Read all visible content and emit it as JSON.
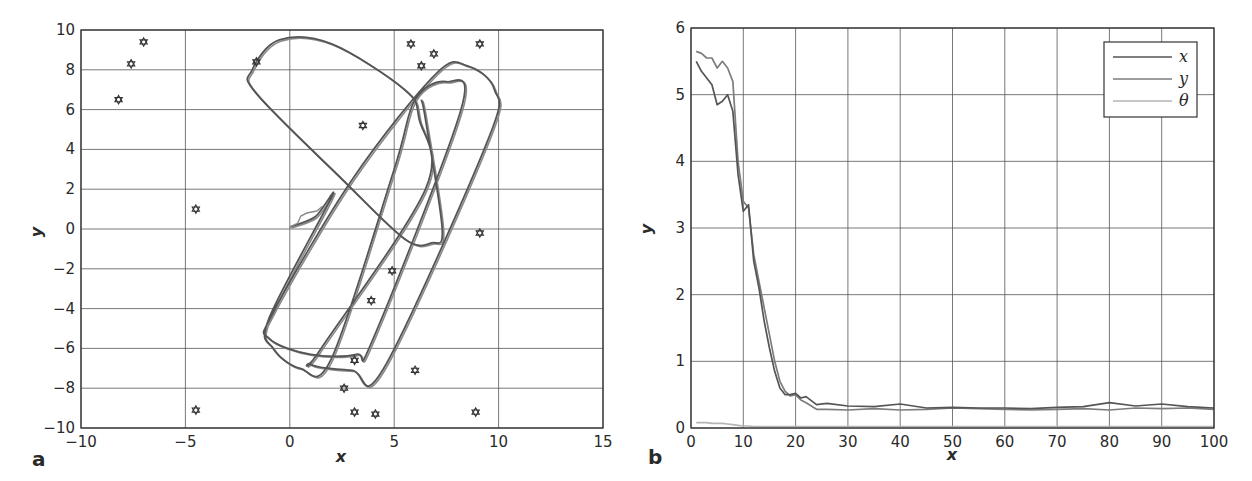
{
  "chart_data": [
    {
      "panel": "a",
      "type": "line",
      "title": "",
      "xlabel": "x",
      "ylabel": "y",
      "xlim": [
        -10,
        15
      ],
      "ylim": [
        -10,
        10
      ],
      "xticks": [
        -10,
        -5,
        0,
        5,
        10,
        15
      ],
      "yticks": [
        -10,
        -8,
        -6,
        -4,
        -2,
        0,
        2,
        4,
        6,
        8,
        10
      ],
      "grid": true,
      "colors": {
        "true_path": "#555555",
        "estimated_path": "#8a8a8a",
        "landmark": "#333333"
      },
      "landmarks": [
        [
          -8.2,
          6.5
        ],
        [
          -7.6,
          8.3
        ],
        [
          -7.0,
          9.4
        ],
        [
          -1.6,
          8.4
        ],
        [
          -4.5,
          1.0
        ],
        [
          3.5,
          5.2
        ],
        [
          5.8,
          9.3
        ],
        [
          6.3,
          8.2
        ],
        [
          6.9,
          8.8
        ],
        [
          9.1,
          9.3
        ],
        [
          9.1,
          -0.2
        ],
        [
          4.9,
          -2.1
        ],
        [
          3.9,
          -3.6
        ],
        [
          3.1,
          -6.6
        ],
        [
          6.0,
          -7.1
        ],
        [
          2.6,
          -8.0
        ],
        [
          3.1,
          -9.2
        ],
        [
          4.1,
          -9.3
        ],
        [
          8.9,
          -9.2
        ],
        [
          -4.5,
          -9.1
        ]
      ],
      "series": [
        {
          "name": "true trajectory",
          "points": [
            [
              0.0,
              0.1
            ],
            [
              1.2,
              0.6
            ],
            [
              2.0,
              1.6
            ],
            [
              -1.0,
              -4.5
            ],
            [
              -0.8,
              -6.0
            ],
            [
              0.5,
              -7.0
            ],
            [
              2.0,
              -6.5
            ],
            [
              5.0,
              3.0
            ],
            [
              6.0,
              6.5
            ],
            [
              7.5,
              7.4
            ],
            [
              8.2,
              6.0
            ],
            [
              4.0,
              -5.5
            ],
            [
              3.2,
              -6.3
            ],
            [
              1.0,
              -6.3
            ],
            [
              -1.0,
              -5.5
            ],
            [
              -0.8,
              -4.2
            ],
            [
              3.0,
              2.5
            ],
            [
              7.0,
              7.8
            ],
            [
              8.5,
              8.2
            ],
            [
              9.8,
              7.0
            ],
            [
              9.5,
              4.5
            ],
            [
              4.5,
              -7.0
            ],
            [
              3.0,
              -7.1
            ],
            [
              1.0,
              -6.8
            ],
            [
              1.5,
              -6.0
            ],
            [
              6.5,
              2.0
            ],
            [
              6.2,
              5.5
            ],
            [
              5.5,
              7.0
            ],
            [
              2.0,
              9.3
            ],
            [
              -0.5,
              9.5
            ],
            [
              -1.8,
              8.0
            ],
            [
              -1.6,
              6.8
            ],
            [
              2.5,
              2.5
            ],
            [
              5.5,
              -0.5
            ],
            [
              6.8,
              -0.7
            ],
            [
              7.3,
              0.0
            ],
            [
              6.5,
              5.5
            ],
            [
              6.3,
              6.5
            ]
          ]
        }
      ],
      "start_point": [
        0.0,
        0.1
      ],
      "panel_label": "a"
    },
    {
      "panel": "b",
      "type": "line",
      "title": "",
      "xlabel": "x",
      "ylabel": "y",
      "xlim": [
        0,
        100
      ],
      "ylim": [
        0,
        6
      ],
      "xticks": [
        0,
        10,
        20,
        30,
        40,
        50,
        60,
        70,
        80,
        90,
        100
      ],
      "yticks": [
        0,
        1,
        2,
        3,
        4,
        5,
        6
      ],
      "grid": true,
      "legend": {
        "position": "upper right",
        "entries": [
          "x",
          "y",
          "θ"
        ]
      },
      "x": [
        1,
        2,
        3,
        4,
        5,
        6,
        7,
        8,
        9,
        10,
        11,
        12,
        13,
        14,
        15,
        16,
        17,
        18,
        19,
        20,
        21,
        22,
        24,
        26,
        30,
        35,
        40,
        45,
        50,
        55,
        60,
        65,
        70,
        75,
        80,
        85,
        90,
        95,
        100
      ],
      "series": [
        {
          "name": "x",
          "color": "#555555",
          "values": [
            5.5,
            5.35,
            5.25,
            5.15,
            4.85,
            4.9,
            5.0,
            4.75,
            3.8,
            3.25,
            3.35,
            2.5,
            2.1,
            1.6,
            1.2,
            0.85,
            0.6,
            0.5,
            0.5,
            0.52,
            0.45,
            0.47,
            0.35,
            0.37,
            0.33,
            0.32,
            0.36,
            0.3,
            0.31,
            0.3,
            0.3,
            0.29,
            0.31,
            0.32,
            0.38,
            0.33,
            0.36,
            0.32,
            0.3
          ]
        },
        {
          "name": "y",
          "color": "#7d7d7d",
          "values": [
            5.65,
            5.62,
            5.55,
            5.55,
            5.4,
            5.5,
            5.4,
            5.2,
            4.0,
            3.4,
            3.3,
            2.6,
            2.2,
            1.8,
            1.4,
            1.0,
            0.7,
            0.55,
            0.48,
            0.5,
            0.42,
            0.38,
            0.28,
            0.28,
            0.27,
            0.29,
            0.27,
            0.28,
            0.3,
            0.29,
            0.28,
            0.27,
            0.28,
            0.29,
            0.27,
            0.3,
            0.29,
            0.3,
            0.28
          ]
        },
        {
          "name": "θ",
          "color": "#b5b5b5",
          "values": [
            0.08,
            0.08,
            0.08,
            0.07,
            0.07,
            0.07,
            0.06,
            0.05,
            0.04,
            0.03,
            0.03,
            0.02,
            0.02,
            0.02,
            0.02,
            0.02,
            0.02,
            0.02,
            0.02,
            0.02,
            0.02,
            0.02,
            0.02,
            0.02,
            0.02,
            0.02,
            0.02,
            0.02,
            0.02,
            0.02,
            0.02,
            0.02,
            0.02,
            0.02,
            0.02,
            0.02,
            0.02,
            0.02,
            0.02
          ]
        }
      ],
      "panel_label": "b"
    }
  ],
  "panels": {
    "a": {
      "label": "a",
      "xlabel": "x",
      "ylabel": "y",
      "xtick_labels": [
        "−10",
        "−5",
        "0",
        "5",
        "10",
        "15"
      ],
      "ytick_labels": [
        "10",
        "8",
        "6",
        "4",
        "2",
        "0",
        "−2",
        "−4",
        "−6",
        "−8",
        "−10"
      ]
    },
    "b": {
      "label": "b",
      "xlabel": "x",
      "ylabel": "y",
      "xtick_labels": [
        "0",
        "10",
        "20",
        "30",
        "40",
        "50",
        "60",
        "70",
        "80",
        "90",
        "100"
      ],
      "ytick_labels": [
        "6",
        "5",
        "4",
        "3",
        "2",
        "1",
        "0"
      ],
      "legend": [
        {
          "label": "x",
          "color": "#555555"
        },
        {
          "label": "y",
          "color": "#7d7d7d"
        },
        {
          "label": "θ",
          "color": "#b5b5b5"
        }
      ]
    }
  }
}
